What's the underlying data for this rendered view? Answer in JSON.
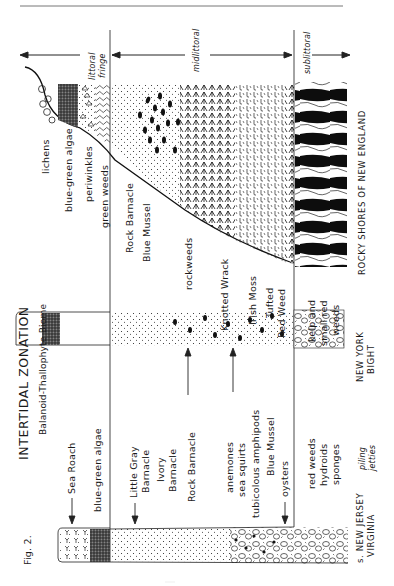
{
  "figure": {
    "label": "Fig. 2.",
    "title": "INTERTIDAL ZONATION",
    "subtitle": "Balanoid-Thallophyte Biome",
    "orientation": "rotated 90° counter-clockwise"
  },
  "zones": [
    {
      "name": "littoral_fringe",
      "label_line1": "littoral",
      "label_line2": "fringe"
    },
    {
      "name": "midlittoral",
      "label": "midlittoral"
    },
    {
      "name": "sublittoral",
      "label": "sublittoral"
    }
  ],
  "rocky_shores": {
    "caption": "ROCKY SHORES OF NEW ENGLAND",
    "labels": {
      "lichens": "lichens",
      "blue_green_algae": "blue-green algae",
      "periwinkles": "periwinkles",
      "green_weeds": "green weeds",
      "rock_barnacle": "Rock Barnacle",
      "blue_mussel": "Blue Mussel",
      "rockweeds": "rockweeds",
      "knotted_wrack": "Knotted Wrack",
      "irish_moss": "Irish Moss",
      "tufted_line1": "Tufted",
      "tufted_line2": "Red Weed",
      "kelp_line1": "kelp and",
      "kelp_line2": "small red",
      "kelp_line3": "weeds"
    }
  },
  "new_york_bight": {
    "caption_line1": "NEW YORK",
    "caption_line2": "BIGHT"
  },
  "new_jersey_virginia": {
    "caption_line1": "s. NEW JERSEY",
    "caption_line2": "VIRGINIA",
    "piling_line1": "piling",
    "piling_line2": "jetties",
    "labels": {
      "sea_roach": "Sea Roach",
      "blue_green_algae": "blue-green algae",
      "little_gray_line1": "Little Gray",
      "little_gray_line2": "Barnacle",
      "ivory_line1": "Ivory",
      "ivory_line2": "Barnacle",
      "rock_barnacle": "Rock Barnacle",
      "anemones": "anemones",
      "sea_squirts": "sea squirts",
      "amphipods": "tubicolous amphipods",
      "blue_mussel": "Blue Mussel",
      "oysters": "oysters",
      "red_weeds": "red weeds",
      "hydroids": "hydroids",
      "sponges": "sponges"
    }
  },
  "colors": {
    "ink": "#1a1a1a",
    "paper": "#ffffff",
    "rule": "#555555"
  }
}
